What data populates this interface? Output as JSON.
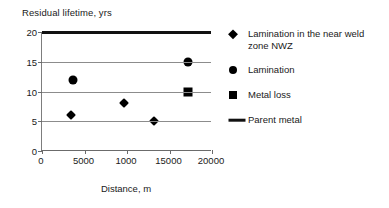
{
  "chart_data": {
    "type": "scatter",
    "title": "",
    "xlabel": "Distance, m",
    "ylabel": "Residual lifetime, yrs",
    "xlim": [
      0,
      20000
    ],
    "ylim": [
      0,
      20
    ],
    "xticks": [
      "0",
      "5000",
      "1000",
      "15000",
      "20000"
    ],
    "xtick_values": [
      0,
      5000,
      10000,
      15000,
      20000
    ],
    "yticks": [
      "0",
      "5",
      "10",
      "15",
      "20"
    ],
    "ytick_values": [
      0,
      5,
      10,
      15,
      20
    ],
    "grid": "horizontal",
    "legend_position": "right",
    "series": [
      {
        "name": "Lamination in the near weld zone NWZ",
        "marker": "diamond",
        "color": "#000000",
        "points": [
          {
            "x": 3400,
            "y": 6
          },
          {
            "x": 9600,
            "y": 8
          },
          {
            "x": 13200,
            "y": 5
          }
        ]
      },
      {
        "name": "Lamination",
        "marker": "circle",
        "color": "#000000",
        "points": [
          {
            "x": 3600,
            "y": 12
          },
          {
            "x": 17200,
            "y": 15
          }
        ]
      },
      {
        "name": "Metal loss",
        "marker": "square",
        "color": "#000000",
        "points": [
          {
            "x": 17200,
            "y": 10
          }
        ]
      },
      {
        "name": "Parent metal",
        "marker": "line",
        "color": "#111111",
        "line_y": 20,
        "points": [
          {
            "x": 0,
            "y": 20
          },
          {
            "x": 20000,
            "y": 20
          }
        ]
      }
    ]
  },
  "legend": {
    "items": [
      {
        "label": "Lamination in the near weld zone NWZ",
        "marker": "diamond"
      },
      {
        "label": "Lamination",
        "marker": "circle"
      },
      {
        "label": "Metal loss",
        "marker": "square"
      },
      {
        "label": "Parent metal",
        "marker": "line"
      }
    ]
  }
}
